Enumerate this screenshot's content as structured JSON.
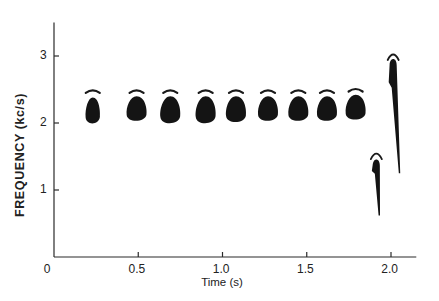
{
  "chart_data": {
    "type": "scatter",
    "subtype": "spectrogram",
    "title": "",
    "xlabel": "Time (s)",
    "ylabel": "FREQUENCY (kc/s)",
    "xlim": [
      0,
      2.15
    ],
    "ylim": [
      0,
      3.5
    ],
    "xticks": [
      0,
      0.5,
      1.0,
      1.5,
      2.0
    ],
    "xtick_labels": [
      "0",
      "0.5",
      "1.0",
      "1.5",
      "2.0"
    ],
    "yticks": [
      1,
      2,
      3
    ],
    "ytick_labels": [
      "1",
      "2",
      "3"
    ],
    "grid": false,
    "legend": null,
    "series": [
      {
        "name": "notes",
        "description": "Repeated note blobs with faint harmonic arc above each",
        "points": [
          {
            "t": 0.23,
            "f_low": 1.97,
            "f_high": 2.38,
            "arc": 2.48
          },
          {
            "t": 0.49,
            "f_low": 2.01,
            "f_high": 2.4,
            "arc": 2.48
          },
          {
            "t": 0.69,
            "f_low": 1.97,
            "f_high": 2.4,
            "arc": 2.48
          },
          {
            "t": 0.9,
            "f_low": 1.97,
            "f_high": 2.4,
            "arc": 2.48
          },
          {
            "t": 1.08,
            "f_low": 1.99,
            "f_high": 2.4,
            "arc": 2.48
          },
          {
            "t": 1.27,
            "f_low": 2.01,
            "f_high": 2.4,
            "arc": 2.48
          },
          {
            "t": 1.45,
            "f_low": 2.01,
            "f_high": 2.4,
            "arc": 2.48
          },
          {
            "t": 1.62,
            "f_low": 2.01,
            "f_high": 2.4,
            "arc": 2.48
          },
          {
            "t": 1.79,
            "f_low": 2.03,
            "f_high": 2.42,
            "arc": 2.5
          }
        ]
      },
      {
        "name": "downsweeps",
        "description": "Terminal descending frequency sweeps",
        "points": [
          {
            "t_start": 1.91,
            "t_end": 1.93,
            "f_start": 1.45,
            "f_end": 0.62,
            "arc": 1.55
          },
          {
            "t_start": 2.01,
            "t_end": 2.05,
            "f_start": 2.95,
            "f_end": 1.25,
            "arc": 3.03
          }
        ]
      }
    ]
  }
}
